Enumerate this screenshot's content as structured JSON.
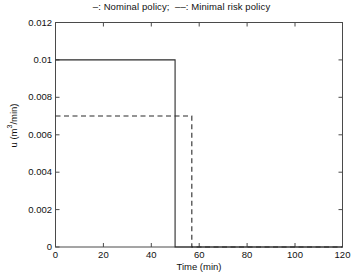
{
  "chart_data": {
    "type": "line",
    "title": "–: Nominal policy;  ––: Minimal risk policy",
    "xlabel": "Time (min)",
    "ylabel": "u (m3/min)",
    "ylabel_base": "u (m",
    "ylabel_exp": "3",
    "ylabel_tail": "/min)",
    "xlim": [
      0,
      120
    ],
    "ylim": [
      0,
      0.012
    ],
    "xticks": [
      0,
      20,
      40,
      60,
      80,
      100,
      120
    ],
    "xticklabels": [
      "0",
      "20",
      "40",
      "60",
      "80",
      "100",
      "120"
    ],
    "yticks": [
      0,
      0.002,
      0.004,
      0.006,
      0.008,
      0.01,
      0.012
    ],
    "yticklabels": [
      "0",
      "0.002",
      "0.004",
      "0.006",
      "0.008",
      "0.01",
      "0.012"
    ],
    "grid": false,
    "legend_position": "title",
    "series": [
      {
        "name": "Nominal policy",
        "style": "solid",
        "color": "#2b2b2b",
        "level": 0.01,
        "switch_time": 50,
        "x": [
          0,
          50,
          50,
          120
        ],
        "y": [
          0.01,
          0.01,
          0,
          0
        ]
      },
      {
        "name": "Minimal risk policy",
        "style": "dashed",
        "color": "#2b2b2b",
        "level": 0.007,
        "switch_time": 57,
        "x": [
          0,
          57,
          57,
          120
        ],
        "y": [
          0.007,
          0.007,
          0,
          0
        ]
      }
    ]
  }
}
